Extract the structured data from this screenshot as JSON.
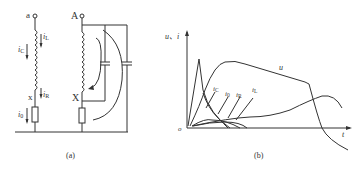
{
  "figure": {
    "panel_a": {
      "caption": "(a)",
      "terminals": {
        "left_top": "a",
        "left_bottom": "x",
        "right_top": "A",
        "right_bottom": "X"
      },
      "current_labels": {
        "iL": "i",
        "iL_sub": "L",
        "iC": "i",
        "iC_sub": "C",
        "iR": "i",
        "iR_sub": "R",
        "i0": "i",
        "i0_sub": "0"
      }
    },
    "panel_b": {
      "caption": "(b)",
      "y_axis_label": "u、i",
      "x_axis_label": "t",
      "origin_label": "o",
      "curve_labels": {
        "u": "u",
        "iC": "i",
        "iC_sub": "C",
        "i0": "i",
        "i0_sub": "0",
        "iR": "i",
        "iR_sub": "R",
        "iL": "i",
        "iL_sub": "L"
      }
    }
  }
}
